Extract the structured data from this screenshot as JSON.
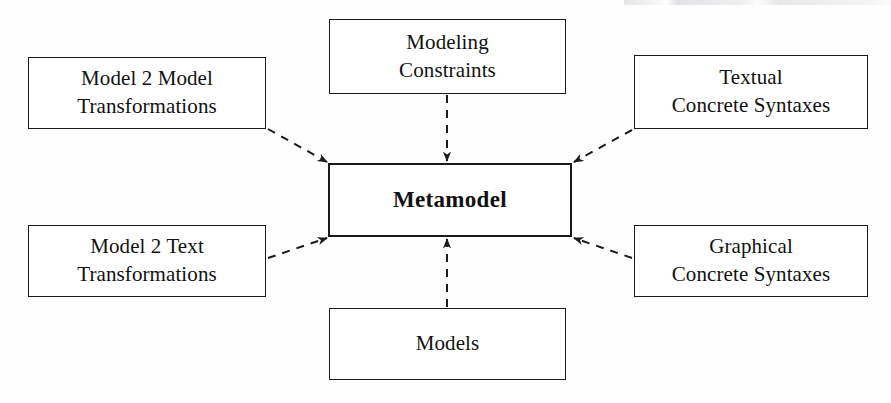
{
  "diagram": {
    "type": "node-edge-diagram",
    "background_color": "#fefefe",
    "line_color": "#1a1a1a",
    "text_color": "#111111",
    "edge_style": "dashed-with-arrowhead",
    "nodes": [
      {
        "id": "model2model",
        "label": "Model 2 Model\nTransformations",
        "x": 28,
        "y": 57,
        "w": 238,
        "h": 72,
        "role": "source"
      },
      {
        "id": "modeling-constraints",
        "label": "Modeling\nConstraints",
        "x": 329,
        "y": 19,
        "w": 237,
        "h": 75,
        "role": "source"
      },
      {
        "id": "textual-concrete-syntaxes",
        "label": "Textual\nConcrete Syntaxes",
        "x": 634,
        "y": 55,
        "w": 234,
        "h": 74,
        "role": "source"
      },
      {
        "id": "metamodel",
        "label": "Metamodel",
        "x": 328,
        "y": 163,
        "w": 244,
        "h": 74,
        "role": "center"
      },
      {
        "id": "model2text",
        "label": "Model 2 Text\nTransformations",
        "x": 28,
        "y": 225,
        "w": 238,
        "h": 72,
        "role": "source"
      },
      {
        "id": "graphical-concrete-syntaxes",
        "label": "Graphical\nConcrete Syntaxes",
        "x": 634,
        "y": 225,
        "w": 234,
        "h": 72,
        "role": "source"
      },
      {
        "id": "models",
        "label": "Models",
        "x": 329,
        "y": 308,
        "w": 237,
        "h": 72,
        "role": "source"
      }
    ],
    "edges": [
      {
        "id": "e-model2model",
        "from": "model2model",
        "to": "metamodel",
        "x1": 268,
        "y1": 129,
        "x2": 327,
        "y2": 162
      },
      {
        "id": "e-modeling-constraints",
        "from": "modeling-constraints",
        "to": "metamodel",
        "x1": 447,
        "y1": 95,
        "x2": 447,
        "y2": 161
      },
      {
        "id": "e-textual-concrete-syntaxes",
        "from": "textual-concrete-syntaxes",
        "to": "metamodel",
        "x1": 632,
        "y1": 130,
        "x2": 574,
        "y2": 162
      },
      {
        "id": "e-model2text",
        "from": "model2text",
        "to": "metamodel",
        "x1": 268,
        "y1": 258,
        "x2": 327,
        "y2": 238
      },
      {
        "id": "e-graphical-concrete-syntaxes",
        "from": "graphical-concrete-syntaxes",
        "to": "metamodel",
        "x1": 632,
        "y1": 258,
        "x2": 574,
        "y2": 238
      },
      {
        "id": "e-models",
        "from": "models",
        "to": "metamodel",
        "x1": 447,
        "y1": 307,
        "x2": 447,
        "y2": 239
      }
    ]
  }
}
